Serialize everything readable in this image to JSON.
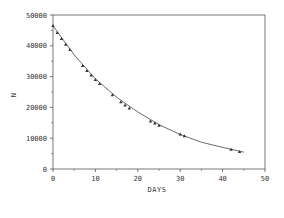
{
  "chart_data": {
    "type": "scatter",
    "title": "",
    "xlabel": "DAYS",
    "ylabel": "N",
    "xlim": [
      0,
      50
    ],
    "ylim": [
      0,
      50000
    ],
    "x_ticks": [
      0,
      10,
      20,
      30,
      40,
      50
    ],
    "y_ticks": [
      0,
      10000,
      20000,
      30000,
      40000,
      50000
    ],
    "x_tick_labels": [
      "0",
      "10",
      "20",
      "30",
      "40",
      "50"
    ],
    "y_tick_labels": [
      "0",
      "10000",
      "20000",
      "30000",
      "40000",
      "50000"
    ],
    "grid": false,
    "legend": null,
    "series": [
      {
        "name": "observed",
        "marker": "triangle",
        "x": [
          0,
          1,
          2,
          3,
          4,
          7,
          8,
          9,
          10,
          11,
          14,
          16,
          17,
          18,
          23,
          24,
          25,
          30,
          31,
          42,
          44
        ],
        "y": [
          46500,
          44200,
          42300,
          40400,
          38700,
          33500,
          31900,
          30400,
          29000,
          27700,
          24000,
          21700,
          20700,
          19700,
          15500,
          14800,
          14100,
          11300,
          10700,
          6300,
          5600
        ]
      },
      {
        "name": "fitted curve",
        "type": "line",
        "x": [
          0,
          5,
          10,
          15,
          20,
          25,
          30,
          35,
          40,
          45
        ],
        "y": [
          46500,
          37000,
          29300,
          23300,
          18500,
          14400,
          11200,
          8700,
          7000,
          5500
        ]
      }
    ]
  },
  "colors": {
    "axis": "#555555",
    "marker": "#333333",
    "line": "#444444"
  }
}
